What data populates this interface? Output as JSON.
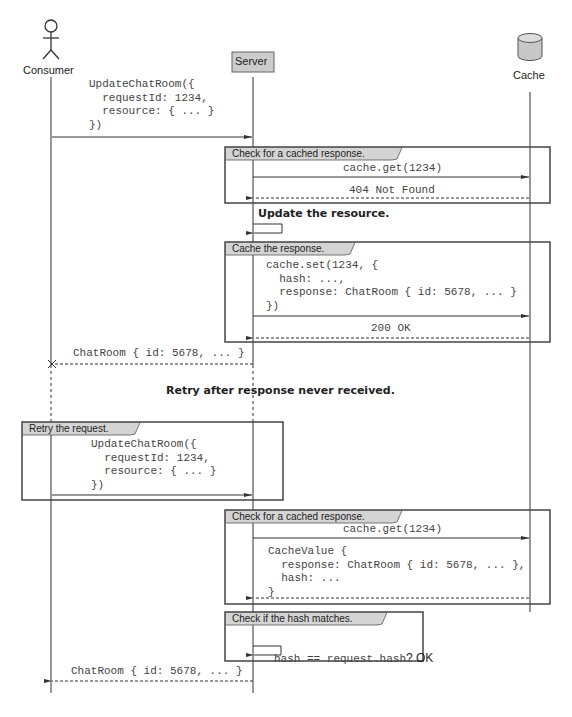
{
  "participants": [
    {
      "id": "consumer",
      "label": "Consumer",
      "type": "actor"
    },
    {
      "id": "server",
      "label": "Server",
      "type": "box"
    },
    {
      "id": "cache",
      "label": "Cache",
      "type": "database"
    }
  ],
  "messages": {
    "initial_request": "UpdateChatRoom({\n  requestId: 1234,\n  resource: { ... }\n})",
    "first_check": {
      "frame_label": "Check for a cached response.",
      "get_call": "cache.get(1234)",
      "get_result": "404 Not Found"
    },
    "update_note": "Update the resource.",
    "cache_set": {
      "frame_label": "Cache the response.",
      "set_call": "cache.set(1234, {\n  hash: ...,\n  response: ChatRoom { id: 5678, ... }\n})",
      "set_result": "200 OK"
    },
    "lost_response": "ChatRoom { id: 5678, ... }",
    "retry_note": "Retry after response never received.",
    "retry": {
      "frame_label": "Retry the request.",
      "request": "UpdateChatRoom({\n  requestId: 1234,\n  resource: { ... }\n})"
    },
    "second_check": {
      "frame_label": "Check for a cached response.",
      "get_call": "cache.get(1234)",
      "get_result": "CacheValue {\n  response: ChatRoom { id: 5678, ... },\n  hash: ...\n}"
    },
    "hash_check": {
      "frame_label": "Check if the hash matches.",
      "expression": "hash == request.hash",
      "result": "? OK"
    },
    "final_response": "ChatRoom { id: 5678, ... }"
  },
  "colors": {
    "line": "#333333",
    "frame_border": "#444444",
    "tab_fill": "#d4d4d4",
    "server_fill": "#cccccc",
    "cache_fill": "#c8c8c8"
  }
}
